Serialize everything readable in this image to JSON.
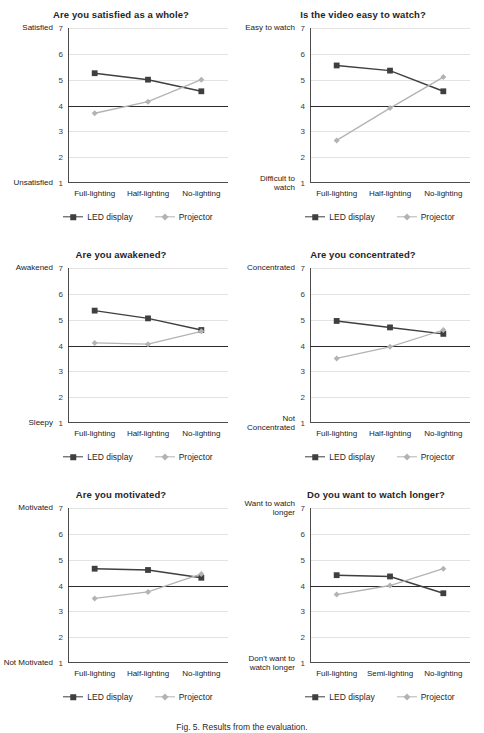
{
  "figure": {
    "caption": "Fig. 5. Results from the evaluation.",
    "legend": {
      "led_label": "LED display",
      "projector_label": "Projector"
    },
    "colors": {
      "led": "#3f3f3f",
      "projector": "#b3b3b3",
      "axis": "#4d4d4d",
      "midline": "#2b2b2b",
      "grid": "#e3e3e3"
    }
  },
  "chart_data": [
    {
      "type": "line",
      "title": "Are you satisfied as a whole?",
      "categories": [
        "Full-lighting",
        "Half-lighting",
        "No-lighting"
      ],
      "series": [
        {
          "name": "LED display",
          "values": [
            5.25,
            5.0,
            4.55
          ]
        },
        {
          "name": "Projector",
          "values": [
            3.7,
            4.15,
            5.0
          ]
        }
      ],
      "ylim": [
        1,
        7
      ],
      "yticks": [
        1,
        2,
        3,
        4,
        5,
        6,
        7
      ],
      "ylabel_top": "Satisfied",
      "ylabel_bottom": "Unsatisfied",
      "xlabel": "",
      "grid": true,
      "midline": 4
    },
    {
      "type": "line",
      "title": "Is the video easy to watch?",
      "categories": [
        "Full-lighting",
        "Half-lighting",
        "No-lighting"
      ],
      "series": [
        {
          "name": "LED display",
          "values": [
            5.55,
            5.35,
            4.55
          ]
        },
        {
          "name": "Projector",
          "values": [
            2.65,
            3.9,
            5.1
          ]
        }
      ],
      "ylim": [
        1,
        7
      ],
      "yticks": [
        1,
        2,
        3,
        4,
        5,
        6,
        7
      ],
      "ylabel_top": "Easy to watch",
      "ylabel_bottom": "Difficult to watch",
      "xlabel": "",
      "grid": true,
      "midline": 4
    },
    {
      "type": "line",
      "title": "Are you awakened?",
      "categories": [
        "Full-lighting",
        "Half-lighting",
        "No-lighting"
      ],
      "series": [
        {
          "name": "LED display",
          "values": [
            5.35,
            5.05,
            4.6
          ]
        },
        {
          "name": "Projector",
          "values": [
            4.1,
            4.05,
            4.55
          ]
        }
      ],
      "ylim": [
        1,
        7
      ],
      "yticks": [
        1,
        2,
        3,
        4,
        5,
        6,
        7
      ],
      "ylabel_top": "Awakened",
      "ylabel_bottom": "Sleepy",
      "xlabel": "",
      "grid": true,
      "midline": 4
    },
    {
      "type": "line",
      "title": "Are you concentrated?",
      "categories": [
        "Full-lighting",
        "Half-lighting",
        "No-lighting"
      ],
      "series": [
        {
          "name": "LED display",
          "values": [
            4.95,
            4.7,
            4.45
          ]
        },
        {
          "name": "Projector",
          "values": [
            3.5,
            3.95,
            4.6
          ]
        }
      ],
      "ylim": [
        1,
        7
      ],
      "yticks": [
        1,
        2,
        3,
        4,
        5,
        6,
        7
      ],
      "ylabel_top": "Concentrated",
      "ylabel_bottom": "Not Concentrated",
      "xlabel": "",
      "grid": true,
      "midline": 4
    },
    {
      "type": "line",
      "title": "Are you motivated?",
      "categories": [
        "Full-lighting",
        "Half-lighting",
        "No-lighting"
      ],
      "series": [
        {
          "name": "LED display",
          "values": [
            4.65,
            4.6,
            4.3
          ]
        },
        {
          "name": "Projector",
          "values": [
            3.5,
            3.75,
            4.45
          ]
        }
      ],
      "ylim": [
        1,
        7
      ],
      "yticks": [
        1,
        2,
        3,
        4,
        5,
        6,
        7
      ],
      "ylabel_top": "Motivated",
      "ylabel_bottom": "Not Motivated",
      "xlabel": "",
      "grid": true,
      "midline": 4
    },
    {
      "type": "line",
      "title": "Do you want to watch longer?",
      "categories": [
        "Full-lighting",
        "Semi-lighting",
        "No-lighting"
      ],
      "series": [
        {
          "name": "LED display",
          "values": [
            4.4,
            4.35,
            3.7
          ]
        },
        {
          "name": "Projector",
          "values": [
            3.65,
            4.0,
            4.65
          ]
        }
      ],
      "ylim": [
        1,
        7
      ],
      "yticks": [
        1,
        2,
        3,
        4,
        5,
        6,
        7
      ],
      "ylabel_top": "Want to watch longer",
      "ylabel_bottom": "Don't want to watch longer",
      "xlabel": "",
      "grid": true,
      "midline": 4
    }
  ]
}
